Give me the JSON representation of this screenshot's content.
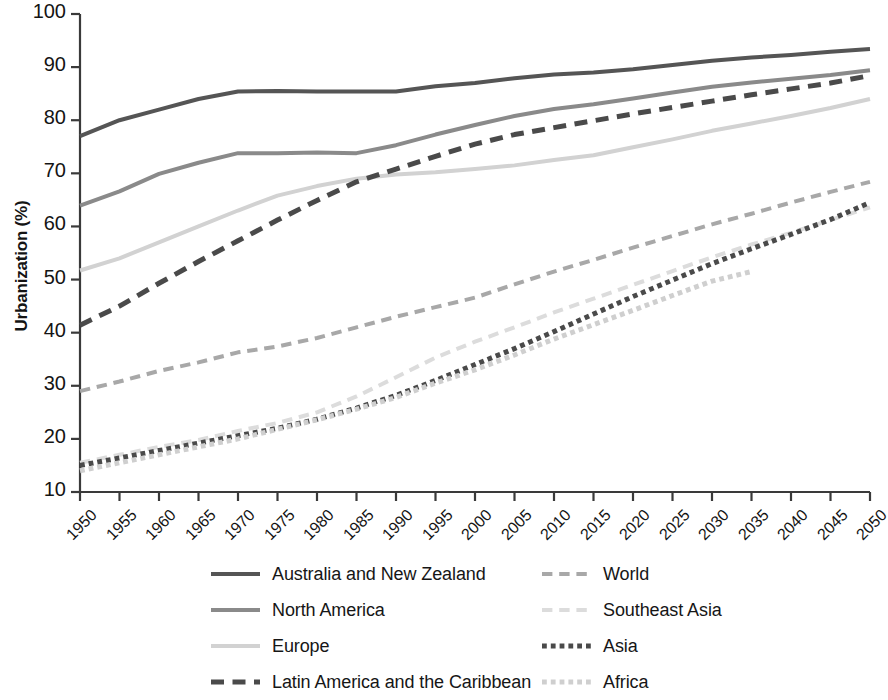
{
  "chart_data": {
    "type": "line",
    "title": "",
    "subtitle": "",
    "xlabel": "",
    "ylabel": "Urbanization (%)",
    "xlim": [
      1950,
      2050
    ],
    "ylim": [
      10,
      100
    ],
    "grid": false,
    "legend_position": "bottom",
    "x_tick_labels": [
      "1950",
      "1955",
      "1960",
      "1965",
      "1970",
      "1975",
      "1980",
      "1985",
      "1990",
      "1995",
      "2000",
      "2005",
      "2010",
      "2015",
      "2020",
      "2025",
      "2030",
      "2035",
      "2040",
      "2045",
      "2050"
    ],
    "y_tick_labels": [
      "100",
      "90",
      "80",
      "70",
      "60",
      "50",
      "40",
      "30",
      "20",
      "10"
    ],
    "y_tick_values": [
      100,
      90,
      80,
      70,
      60,
      50,
      40,
      30,
      20,
      10
    ],
    "x": [
      1950,
      1955,
      1960,
      1965,
      1970,
      1975,
      1980,
      1985,
      1990,
      1995,
      2000,
      2005,
      2010,
      2015,
      2020,
      2025,
      2030,
      2035,
      2040,
      2045,
      2050
    ],
    "series": [
      {
        "name": "Australia and New Zealand",
        "color": "#555555",
        "style": "solid",
        "width": 4,
        "values": [
          77.0,
          80.0,
          82.0,
          84.0,
          85.4,
          85.5,
          85.4,
          85.4,
          85.4,
          86.4,
          87.0,
          87.9,
          88.6,
          89.0,
          89.6,
          90.4,
          91.2,
          91.8,
          92.3,
          92.9,
          93.4
        ]
      },
      {
        "name": "North America",
        "color": "#8a8a8a",
        "style": "solid",
        "width": 4,
        "values": [
          63.9,
          66.6,
          69.9,
          72.0,
          73.8,
          73.8,
          73.9,
          73.8,
          75.3,
          77.3,
          79.1,
          80.8,
          82.1,
          83.0,
          84.1,
          85.2,
          86.3,
          87.1,
          87.8,
          88.5,
          89.4
        ]
      },
      {
        "name": "Europe",
        "color": "#d2d2d2",
        "style": "solid",
        "width": 4,
        "values": [
          51.7,
          54.0,
          57.0,
          60.0,
          63.0,
          65.8,
          67.6,
          69.0,
          69.8,
          70.2,
          70.8,
          71.5,
          72.5,
          73.4,
          74.9,
          76.4,
          78.0,
          79.4,
          80.8,
          82.3,
          84.0
        ]
      },
      {
        "name": "Latin America and the Caribbean",
        "color": "#4a4a4a",
        "style": "dashed",
        "width": 5,
        "values": [
          41.4,
          45.0,
          49.3,
          53.4,
          57.3,
          61.2,
          64.9,
          68.4,
          70.8,
          73.2,
          75.5,
          77.3,
          78.6,
          79.9,
          81.2,
          82.4,
          83.6,
          84.8,
          85.9,
          87.0,
          88.4
        ]
      },
      {
        "name": "World",
        "color": "#a8a8a8",
        "style": "dashed",
        "width": 4,
        "values": [
          29.0,
          30.8,
          32.8,
          34.4,
          36.3,
          37.4,
          39.0,
          41.0,
          43.0,
          44.8,
          46.6,
          49.1,
          51.5,
          53.7,
          56.0,
          58.2,
          60.4,
          62.4,
          64.5,
          66.5,
          68.4
        ]
      },
      {
        "name": "Southeast Asia",
        "color": "#dcdcdc",
        "style": "dashed",
        "width": 4,
        "values": [
          15.5,
          17.0,
          18.5,
          19.8,
          21.5,
          23.0,
          25.0,
          28.0,
          31.6,
          35.3,
          38.3,
          41.0,
          43.8,
          46.4,
          49.0,
          51.6,
          54.2,
          56.6,
          58.8,
          61.2,
          63.6
        ]
      },
      {
        "name": "Asia",
        "color": "#4a4a4a",
        "style": "dotted",
        "width": 5,
        "values": [
          15.0,
          16.4,
          17.8,
          19.2,
          20.6,
          22.0,
          23.7,
          25.8,
          28.2,
          31.0,
          34.0,
          37.0,
          40.2,
          43.5,
          46.8,
          49.9,
          53.0,
          55.8,
          58.5,
          61.3,
          64.5
        ]
      },
      {
        "name": "Africa",
        "color": "#cfcfcf",
        "style": "dotted",
        "width": 5,
        "values": [
          14.0,
          15.5,
          17.0,
          18.5,
          20.0,
          21.8,
          23.6,
          25.6,
          27.8,
          30.5,
          33.0,
          35.8,
          38.8,
          41.5,
          44.2,
          47.0,
          49.7,
          51.5,
          null,
          null,
          null
        ]
      }
    ]
  },
  "legend": {
    "entries": [
      {
        "label": "Australia and New Zealand",
        "column": "left",
        "row": 0
      },
      {
        "label": "North America",
        "column": "left",
        "row": 1
      },
      {
        "label": "Europe",
        "column": "left",
        "row": 2
      },
      {
        "label": "Latin America and the Caribbean",
        "column": "left",
        "row": 3
      },
      {
        "label": "World",
        "column": "right",
        "row": 0
      },
      {
        "label": "Southeast Asia",
        "column": "right",
        "row": 1
      },
      {
        "label": "Asia",
        "column": "right",
        "row": 2
      },
      {
        "label": "Africa",
        "column": "right",
        "row": 3
      }
    ]
  }
}
